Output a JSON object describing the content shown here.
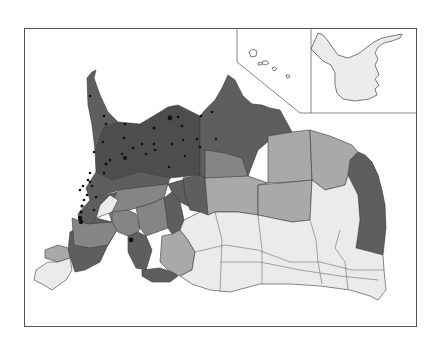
{
  "map": {
    "type": "choropleth",
    "orientation": "rotated-180",
    "frame": {
      "x": 24,
      "y": 28,
      "width": 393,
      "height": 299
    },
    "legend": [],
    "shades": {
      "darkest": "#4d4d4d",
      "dark": "#5e5e5e",
      "medium": "#858585",
      "light": "#a9a9a9",
      "lightest": "#ebebeb",
      "inset_fill": "#f0f0f0",
      "dot": "#111111"
    },
    "insets": [
      {
        "name": "islands-inset",
        "shape": "hawaii-islands"
      },
      {
        "name": "mainland-inset",
        "shape": "alaska"
      }
    ],
    "dots_count": 45
  }
}
